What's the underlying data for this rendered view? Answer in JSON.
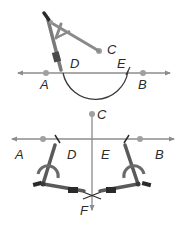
{
  "colors": {
    "line": "#8c8c8c",
    "point": "#a0a0a0",
    "arc": "#3a3a3a",
    "compass_dark": "#4a4a4a",
    "compass_mid": "#7a7a7a",
    "compass_light": "#9a9a9a",
    "label": "#2a2a2a"
  },
  "top_figure": {
    "labels": {
      "A": "A",
      "B": "B",
      "C": "C",
      "D": "D",
      "E": "E"
    }
  },
  "bottom_figure": {
    "labels": {
      "A": "A",
      "B": "B",
      "C": "C",
      "D": "D",
      "E": "E",
      "F": "F"
    }
  }
}
